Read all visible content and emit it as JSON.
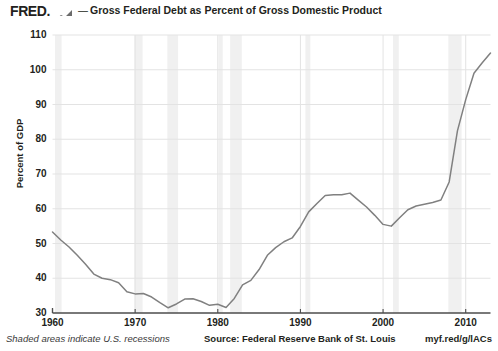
{
  "header": {
    "brand": "FRED.",
    "brand_icon": "rising-chart-icon",
    "separator": "—",
    "title": "Gross Federal Debt as Percent of Gross Domestic Product"
  },
  "footer": {
    "recession_note": "Shaded areas indicate U.S. recessions",
    "source": "Source: Federal Reserve Bank of St. Louis",
    "url": "myf.red/g/lACs"
  },
  "style": {
    "line_color": "#808080",
    "axis_color": "#4d4d4d",
    "grid_color": "#e3e3e3",
    "recession_color": "#f0f0f0",
    "background": "#ffffff",
    "text_color": "#231f20"
  },
  "chart_data": {
    "type": "line",
    "title": "Gross Federal Debt as Percent of Gross Domestic Product",
    "xlabel": "",
    "ylabel": "Percent of GDP",
    "ylim": [
      30,
      110
    ],
    "xlim": [
      1960,
      2013
    ],
    "yticks": [
      30,
      40,
      50,
      60,
      70,
      80,
      90,
      100,
      110
    ],
    "xticks": [
      1960,
      1970,
      1980,
      1990,
      2000,
      2010
    ],
    "grid": true,
    "legend": "none",
    "series": [
      {
        "name": "Gross Federal Debt as Percent of Gross Domestic Product",
        "color": "#808080",
        "x": [
          1960,
          1961,
          1962,
          1963,
          1964,
          1965,
          1966,
          1967,
          1968,
          1969,
          1970,
          1971,
          1972,
          1973,
          1974,
          1975,
          1976,
          1977,
          1978,
          1979,
          1980,
          1981,
          1982,
          1983,
          1984,
          1985,
          1986,
          1987,
          1988,
          1989,
          1990,
          1991,
          1992,
          1993,
          1994,
          1995,
          1996,
          1997,
          1998,
          1999,
          2000,
          2001,
          2002,
          2003,
          2004,
          2005,
          2006,
          2007,
          2008,
          2009,
          2010,
          2011,
          2012,
          2013
        ],
        "values": [
          53.3,
          51.0,
          49.0,
          46.6,
          44.0,
          41.2,
          40.0,
          39.6,
          38.7,
          36.1,
          35.5,
          35.6,
          34.6,
          33.0,
          31.5,
          32.6,
          34.0,
          34.1,
          33.3,
          32.2,
          32.5,
          31.6,
          34.2,
          38.1,
          39.4,
          42.5,
          46.6,
          48.8,
          50.5,
          51.6,
          54.9,
          59.1,
          61.5,
          63.8,
          64.0,
          64.0,
          64.5,
          62.5,
          60.5,
          58.1,
          55.5,
          55.0,
          57.4,
          59.7,
          60.8,
          61.3,
          61.8,
          62.5,
          67.7,
          82.4,
          91.4,
          99.0,
          102.0,
          104.8
        ]
      }
    ],
    "recessions": [
      {
        "start": 1960.3,
        "end": 1961.1
      },
      {
        "start": 1969.9,
        "end": 1970.9
      },
      {
        "start": 1973.9,
        "end": 1975.2
      },
      {
        "start": 1980.1,
        "end": 1980.6
      },
      {
        "start": 1981.5,
        "end": 1982.9
      },
      {
        "start": 1990.6,
        "end": 1991.2
      },
      {
        "start": 2001.2,
        "end": 2001.9
      },
      {
        "start": 2007.9,
        "end": 2009.5
      }
    ],
    "annotations": []
  }
}
